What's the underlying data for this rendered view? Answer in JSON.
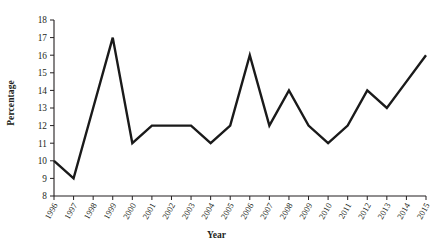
{
  "chart_data": {
    "type": "line",
    "title": "",
    "xlabel": "Year",
    "ylabel": "Percentage",
    "grid": false,
    "legend": false,
    "ylim": [
      8,
      18
    ],
    "ytick_step": 1,
    "yticks": [
      "18",
      "17",
      "16",
      "15",
      "14",
      "13",
      "12",
      "11",
      "10",
      "9",
      "8"
    ],
    "categories": [
      "1996",
      "1997",
      "1998",
      "1999",
      "2000",
      "2001",
      "2002",
      "2003",
      "2004",
      "2005",
      "2006",
      "2007",
      "2008",
      "2009",
      "2010",
      "2011",
      "2012",
      "2013",
      "2014",
      "2015"
    ],
    "values": [
      10,
      9,
      13,
      17,
      11,
      12,
      12,
      12,
      11,
      12,
      16,
      12,
      14,
      12,
      11,
      12,
      14,
      13,
      14.5,
      16
    ],
    "series": [
      {
        "name": "Percentage",
        "color": "#1a1a1a",
        "values": [
          10,
          9,
          13,
          17,
          11,
          12,
          12,
          12,
          11,
          12,
          16,
          12,
          14,
          12,
          11,
          12,
          14,
          13,
          14.5,
          16
        ]
      }
    ]
  }
}
